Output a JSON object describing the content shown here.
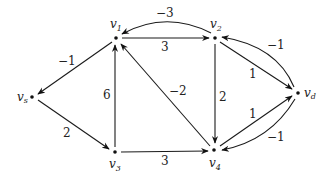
{
  "diagram": {
    "type": "directed-weighted-graph",
    "nodes": [
      {
        "id": "v1",
        "label": "v",
        "sub": "1",
        "x": 116,
        "y": 38
      },
      {
        "id": "v2",
        "label": "v",
        "sub": "2",
        "x": 215,
        "y": 38
      },
      {
        "id": "vs",
        "label": "v",
        "sub": "s",
        "x": 32,
        "y": 97
      },
      {
        "id": "v3",
        "label": "v",
        "sub": "3",
        "x": 115,
        "y": 152
      },
      {
        "id": "v4",
        "label": "v",
        "sub": "4",
        "x": 214,
        "y": 150
      },
      {
        "id": "vd",
        "label": "v",
        "sub": "d",
        "x": 298,
        "y": 93
      }
    ],
    "edges": [
      {
        "from": "v2",
        "to": "v1",
        "weight": "−3",
        "curved": true
      },
      {
        "from": "v1",
        "to": "v2",
        "weight": "3",
        "curved": false
      },
      {
        "from": "v1",
        "to": "vs",
        "weight": "−1",
        "curved": false
      },
      {
        "from": "vs",
        "to": "v3",
        "weight": "2",
        "curved": false
      },
      {
        "from": "v3",
        "to": "v1",
        "weight": "6",
        "curved": false
      },
      {
        "from": "v4",
        "to": "v1",
        "weight": "−2",
        "curved": false
      },
      {
        "from": "v2",
        "to": "v4",
        "weight": "2",
        "curved": false
      },
      {
        "from": "v3",
        "to": "v4",
        "weight": "3",
        "curved": false
      },
      {
        "from": "v2",
        "to": "vd",
        "weight": "1",
        "curved": false
      },
      {
        "from": "vd",
        "to": "v2",
        "weight": "−1",
        "curved": true
      },
      {
        "from": "v4",
        "to": "vd",
        "weight": "1",
        "curved": false
      },
      {
        "from": "vd",
        "to": "v4",
        "weight": "−1",
        "curved": true
      }
    ]
  }
}
